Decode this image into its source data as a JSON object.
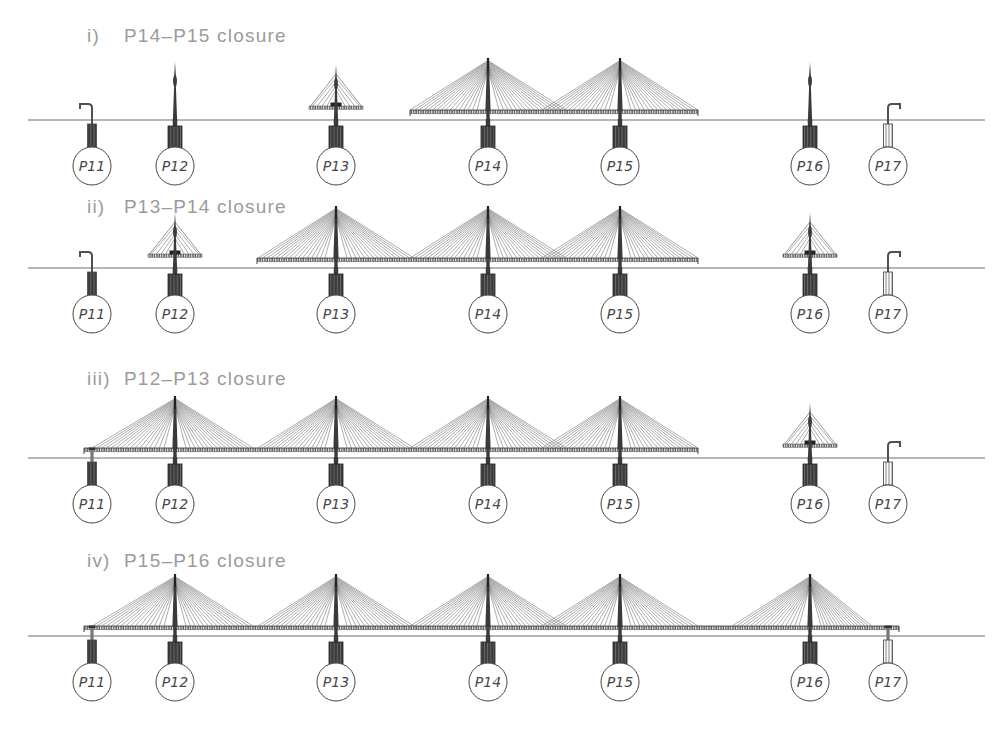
{
  "canvas": {
    "width": 998,
    "height": 737,
    "background": "#ffffff"
  },
  "colors": {
    "ground": "#6e6e6e",
    "cable": "#6b6b6b",
    "structure": "#3a3a3a",
    "deck_edge": "#333333",
    "pier_dark": "#3b3b3b",
    "pier_light": "#fafafa",
    "heading": "#9b9b9b",
    "label": "#474747"
  },
  "ground_line": {
    "x1": 28,
    "x2": 985
  },
  "piers": [
    {
      "id": "P11",
      "x": 92
    },
    {
      "id": "P12",
      "x": 175
    },
    {
      "id": "P13",
      "x": 336
    },
    {
      "id": "P14",
      "x": 488
    },
    {
      "id": "P15",
      "x": 620
    },
    {
      "id": "P16",
      "x": 810
    },
    {
      "id": "P17",
      "x": 888
    }
  ],
  "stages": [
    {
      "numeral": "i)",
      "label": "P14–P15 closure",
      "heading_y": 25,
      "ground_y": 120,
      "deck_spans": [
        [
          410,
          698
        ]
      ],
      "pier_states": {
        "P11": {
          "type": "abutment-hook",
          "dir": -1
        },
        "P12": {
          "type": "spire"
        },
        "P13": {
          "type": "small-fan"
        },
        "P14": {
          "type": "full-fan",
          "left": 78,
          "right": 78
        },
        "P15": {
          "type": "full-fan",
          "left": 78,
          "right": 78
        },
        "P16": {
          "type": "spire"
        },
        "P17": {
          "type": "abutment-hook",
          "dir": 1
        }
      }
    },
    {
      "numeral": "ii)",
      "label": "P13–P14 closure",
      "heading_y": 196,
      "ground_y": 268,
      "deck_spans": [
        [
          257,
          698
        ]
      ],
      "pier_states": {
        "P11": {
          "type": "abutment-hook",
          "dir": -1
        },
        "P12": {
          "type": "small-fan"
        },
        "P13": {
          "type": "full-fan",
          "left": 78,
          "right": 78
        },
        "P14": {
          "type": "full-fan",
          "left": 78,
          "right": 78
        },
        "P15": {
          "type": "full-fan",
          "left": 78,
          "right": 78
        },
        "P16": {
          "type": "small-fan"
        },
        "P17": {
          "type": "abutment-hook",
          "dir": 1
        }
      }
    },
    {
      "numeral": "iii)",
      "label": "P12–P13 closure",
      "heading_y": 368,
      "ground_y": 458,
      "deck_spans": [
        [
          84,
          698
        ]
      ],
      "pier_states": {
        "P11": {
          "type": "abutment-deck"
        },
        "P12": {
          "type": "full-fan",
          "left": 83,
          "right": 78
        },
        "P13": {
          "type": "full-fan",
          "left": 78,
          "right": 78
        },
        "P14": {
          "type": "full-fan",
          "left": 78,
          "right": 78
        },
        "P15": {
          "type": "full-fan",
          "left": 78,
          "right": 78
        },
        "P16": {
          "type": "small-fan"
        },
        "P17": {
          "type": "abutment-hook",
          "dir": 1
        }
      }
    },
    {
      "numeral": "iv)",
      "label": "P15–P16 closure",
      "heading_y": 550,
      "ground_y": 636,
      "deck_spans": [
        [
          84,
          899
        ]
      ],
      "pier_states": {
        "P11": {
          "type": "abutment-deck"
        },
        "P12": {
          "type": "full-fan",
          "left": 83,
          "right": 78
        },
        "P13": {
          "type": "full-fan",
          "left": 78,
          "right": 78
        },
        "P14": {
          "type": "full-fan",
          "left": 78,
          "right": 78
        },
        "P15": {
          "type": "full-fan",
          "left": 78,
          "right": 78
        },
        "P16": {
          "type": "full-fan",
          "left": 78,
          "right": 62
        },
        "P17": {
          "type": "abutment-deck"
        }
      }
    }
  ]
}
